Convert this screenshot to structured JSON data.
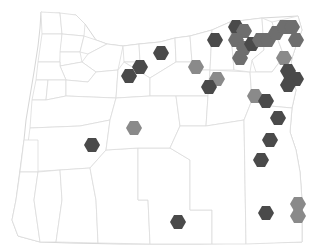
{
  "map": {
    "region": "Oregon",
    "layer": "hexbin",
    "colors": {
      "background": "#ffffff",
      "border": "#d8d8d8",
      "hex_dark": "#4a4a4a",
      "hex_medium": "#6e6e6e",
      "hex_light": "#8a8a8a"
    },
    "hex_radius": 8,
    "hexes": [
      {
        "x": 161,
        "y": 53,
        "shade": "dark"
      },
      {
        "x": 140,
        "y": 67,
        "shade": "dark"
      },
      {
        "x": 129,
        "y": 76,
        "shade": "dark"
      },
      {
        "x": 196,
        "y": 67,
        "shade": "light"
      },
      {
        "x": 217,
        "y": 79,
        "shade": "light"
      },
      {
        "x": 209,
        "y": 87,
        "shade": "dark"
      },
      {
        "x": 215,
        "y": 40,
        "shade": "dark"
      },
      {
        "x": 236,
        "y": 27,
        "shade": "dark"
      },
      {
        "x": 244,
        "y": 31,
        "shade": "medium"
      },
      {
        "x": 236,
        "y": 40,
        "shade": "medium"
      },
      {
        "x": 244,
        "y": 48,
        "shade": "medium"
      },
      {
        "x": 252,
        "y": 44,
        "shade": "dark"
      },
      {
        "x": 260,
        "y": 40,
        "shade": "medium"
      },
      {
        "x": 240,
        "y": 58,
        "shade": "medium"
      },
      {
        "x": 268,
        "y": 40,
        "shade": "medium"
      },
      {
        "x": 276,
        "y": 33,
        "shade": "medium"
      },
      {
        "x": 284,
        "y": 27,
        "shade": "medium"
      },
      {
        "x": 292,
        "y": 27,
        "shade": "medium"
      },
      {
        "x": 296,
        "y": 40,
        "shade": "medium"
      },
      {
        "x": 284,
        "y": 58,
        "shade": "light"
      },
      {
        "x": 288,
        "y": 71,
        "shade": "dark"
      },
      {
        "x": 296,
        "y": 79,
        "shade": "dark"
      },
      {
        "x": 288,
        "y": 85,
        "shade": "dark"
      },
      {
        "x": 255,
        "y": 96,
        "shade": "light"
      },
      {
        "x": 266,
        "y": 101,
        "shade": "dark"
      },
      {
        "x": 278,
        "y": 118,
        "shade": "dark"
      },
      {
        "x": 270,
        "y": 140,
        "shade": "dark"
      },
      {
        "x": 261,
        "y": 160,
        "shade": "dark"
      },
      {
        "x": 134,
        "y": 128,
        "shade": "light"
      },
      {
        "x": 92,
        "y": 145,
        "shade": "dark"
      },
      {
        "x": 178,
        "y": 222,
        "shade": "dark"
      },
      {
        "x": 266,
        "y": 213,
        "shade": "dark"
      },
      {
        "x": 298,
        "y": 204,
        "shade": "light"
      },
      {
        "x": 298,
        "y": 216,
        "shade": "light"
      }
    ]
  }
}
